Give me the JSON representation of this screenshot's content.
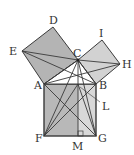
{
  "points": {
    "A": [
      44,
      84
    ],
    "B": [
      96,
      84
    ],
    "C": [
      78,
      60
    ],
    "D": [
      53,
      27
    ],
    "E": [
      22,
      51
    ],
    "H": [
      120,
      64
    ],
    "I": [
      102,
      40
    ],
    "F": [
      44,
      136
    ],
    "G": [
      96,
      136
    ],
    "M": [
      78,
      136
    ],
    "L": [
      78,
      84
    ]
  },
  "labels": {
    "A": "A",
    "B": "B",
    "C": "C",
    "D": "D",
    "E": "E",
    "F": "F",
    "G": "G",
    "H": "H",
    "I": "I",
    "L": "L",
    "M": "M"
  },
  "colors": {
    "dark_fill": "#b4b4b4",
    "light_fill": "#d2d2d2",
    "rect_left": "#b8b8b8",
    "rect_right": "#d8d8d8",
    "line": "#3a3a3a"
  }
}
